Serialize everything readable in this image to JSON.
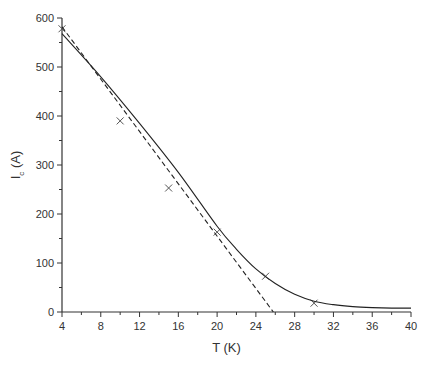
{
  "chart_data": {
    "type": "scatter",
    "title": "",
    "xlabel": "T (K)",
    "ylabel": "I_c (A)",
    "ylabel_main": "I",
    "ylabel_sub": "c",
    "ylabel_unit": "(A)",
    "xlim": [
      4,
      40
    ],
    "ylim": [
      0,
      600
    ],
    "xticks": [
      4,
      8,
      12,
      16,
      20,
      24,
      28,
      32,
      36,
      40
    ],
    "yticks": [
      0,
      100,
      200,
      300,
      400,
      500,
      600
    ],
    "grid": false,
    "legend": null,
    "series": [
      {
        "name": "measured",
        "style": "markers-x",
        "x": [
          4,
          10,
          15,
          20,
          25,
          30
        ],
        "y": [
          578,
          390,
          253,
          163,
          73,
          18
        ]
      },
      {
        "name": "fit-curve",
        "style": "solid-line",
        "x": [
          4,
          8,
          12,
          16,
          20,
          22,
          24,
          26,
          28,
          30,
          32,
          34,
          36,
          38,
          40
        ],
        "y": [
          568,
          480,
          385,
          285,
          175,
          128,
          88,
          58,
          36,
          22,
          15,
          11,
          9,
          8,
          8
        ]
      },
      {
        "name": "linear-fit",
        "style": "dashed-line",
        "x": [
          4,
          25.8
        ],
        "y": [
          582,
          0
        ]
      }
    ]
  }
}
